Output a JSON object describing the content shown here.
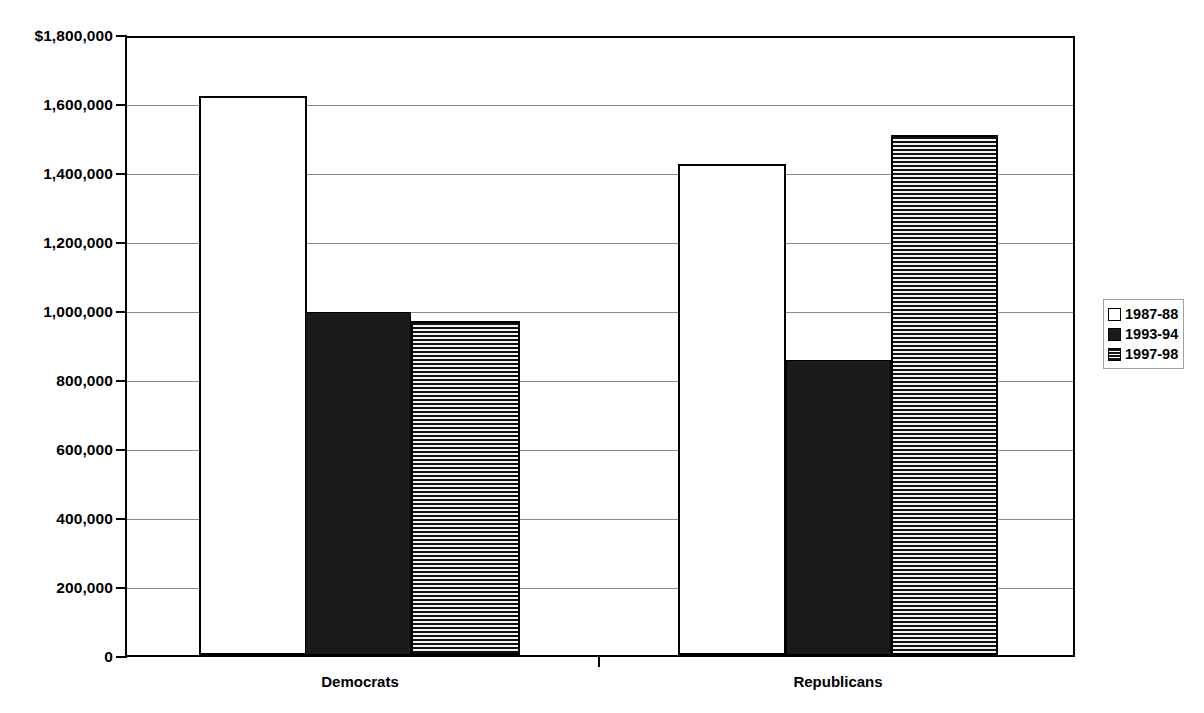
{
  "chart_data": {
    "type": "bar",
    "title": "",
    "subtitle": "",
    "xlabel": "",
    "ylabel": "",
    "categories": [
      "Democrats",
      "Republicans"
    ],
    "series": [
      {
        "name": "1987-88",
        "values": [
          1620000,
          1422000
        ],
        "style": "open-white"
      },
      {
        "name": "1993-94",
        "values": [
          995000,
          855000
        ],
        "style": "solid-black"
      },
      {
        "name": "1997-98",
        "values": [
          968000,
          1508000
        ],
        "style": "horizontal-hatch"
      }
    ],
    "ylim": [
      0,
      1800000
    ],
    "ytick_values": [
      0,
      200000,
      400000,
      600000,
      800000,
      1000000,
      1200000,
      1400000,
      1600000,
      1800000
    ],
    "ytick_labels": [
      "0",
      "200,000",
      "400,000",
      "600,000",
      "800,000",
      "1,000,000",
      "1,200,000",
      "1,400,000",
      "1,600,000",
      "$1,800,000"
    ],
    "grid": true,
    "grid_axis": "y",
    "legend_position": "right",
    "legend_entries": [
      "1987-88",
      "1993-94",
      "1997-98"
    ],
    "colors": {
      "axis": "#000000",
      "gridline": "#8a8a8a",
      "series_1987_88": "#ffffff",
      "series_1993_94": "#1a1a1a",
      "series_1997_98": "#111111",
      "background": "#ffffff"
    }
  },
  "layout": {
    "plot_left_px": 125,
    "plot_top_px": 36,
    "plot_width_px": 950,
    "plot_height_px": 621,
    "bars": [
      {
        "group": "Democrats",
        "series": "1987-88",
        "left_px": 199,
        "width_px": 108,
        "value": 1620000
      },
      {
        "group": "Democrats",
        "series": "1993-94",
        "left_px": 305,
        "width_px": 106,
        "value": 995000
      },
      {
        "group": "Democrats",
        "series": "1997-98",
        "left_px": 411,
        "width_px": 109,
        "value": 968000
      },
      {
        "group": "Republicans",
        "series": "1987-88",
        "left_px": 678,
        "width_px": 108,
        "value": 1422000
      },
      {
        "group": "Republicans",
        "series": "1993-94",
        "left_px": 786,
        "width_px": 105,
        "value": 855000
      },
      {
        "group": "Republicans",
        "series": "1997-98",
        "left_px": 891,
        "width_px": 107,
        "value": 1508000
      }
    ],
    "category_label_x_px": [
      360,
      838
    ],
    "x_tick_marks_px": [
      598
    ]
  }
}
